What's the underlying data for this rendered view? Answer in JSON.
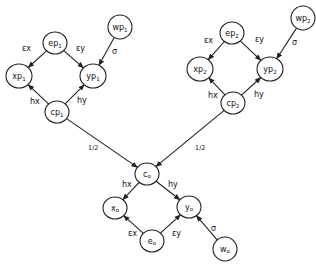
{
  "diagram": {
    "nodes": [
      {
        "id": "ep1",
        "base": "e",
        "sub": "p",
        "subsub": "1",
        "x": 55,
        "y": 43,
        "rx": 12,
        "ry": 11
      },
      {
        "id": "wp1",
        "base": "w",
        "sub": "p",
        "subsub": "1",
        "x": 120,
        "y": 27,
        "rx": 12,
        "ry": 12
      },
      {
        "id": "xp1",
        "base": "x",
        "sub": "p",
        "subsub": "1",
        "x": 19,
        "y": 76,
        "rx": 13,
        "ry": 12
      },
      {
        "id": "yp1",
        "base": "y",
        "sub": "p",
        "subsub": "1",
        "x": 93,
        "y": 76,
        "rx": 13,
        "ry": 12
      },
      {
        "id": "cp1",
        "base": "c",
        "sub": "p",
        "subsub": "1",
        "x": 57,
        "y": 112,
        "rx": 12,
        "ry": 11
      },
      {
        "id": "ep2",
        "base": "e",
        "sub": "p",
        "subsub": "2",
        "x": 232,
        "y": 33,
        "rx": 12,
        "ry": 11
      },
      {
        "id": "wp2",
        "base": "w",
        "sub": "p",
        "subsub": "2",
        "x": 303,
        "y": 18,
        "rx": 12,
        "ry": 12
      },
      {
        "id": "xp2",
        "base": "x",
        "sub": "p",
        "subsub": "2",
        "x": 200,
        "y": 69,
        "rx": 13,
        "ry": 12
      },
      {
        "id": "yp2",
        "base": "y",
        "sub": "p",
        "subsub": "2",
        "x": 270,
        "y": 69,
        "rx": 13,
        "ry": 12
      },
      {
        "id": "cp2",
        "base": "c",
        "sub": "p",
        "subsub": "2",
        "x": 233,
        "y": 103,
        "rx": 12,
        "ry": 11
      },
      {
        "id": "co",
        "base": "c",
        "sub": "o",
        "subsub": "",
        "x": 147,
        "y": 174,
        "rx": 12,
        "ry": 11
      },
      {
        "id": "xo",
        "base": "x",
        "sub": "o",
        "subsub": "",
        "x": 115,
        "y": 208,
        "rx": 12,
        "ry": 11
      },
      {
        "id": "yo",
        "base": "y",
        "sub": "o",
        "subsub": "",
        "x": 189,
        "y": 207,
        "rx": 12,
        "ry": 11
      },
      {
        "id": "eo",
        "base": "e",
        "sub": "o",
        "subsub": "",
        "x": 152,
        "y": 241,
        "rx": 12,
        "ry": 11
      },
      {
        "id": "wo",
        "base": "w",
        "sub": "o",
        "subsub": "",
        "x": 225,
        "y": 249,
        "rx": 12,
        "ry": 12
      }
    ],
    "edges": [
      {
        "from": "ep1",
        "to": "xp1",
        "label": "εx",
        "lx": 22,
        "ly": 51
      },
      {
        "from": "ep1",
        "to": "yp1",
        "label": "εy",
        "lx": 76,
        "ly": 51
      },
      {
        "from": "wp1",
        "to": "yp1",
        "label": "σ",
        "lx": 112,
        "ly": 54
      },
      {
        "from": "cp1",
        "to": "xp1",
        "label": "hx",
        "lx": 30,
        "ly": 104
      },
      {
        "from": "cp1",
        "to": "yp1",
        "label": "hy",
        "lx": 77,
        "ly": 103
      },
      {
        "from": "ep2",
        "to": "xp2",
        "label": "εx",
        "lx": 204,
        "ly": 43
      },
      {
        "from": "ep2",
        "to": "yp2",
        "label": "εy",
        "lx": 255,
        "ly": 42
      },
      {
        "from": "wp2",
        "to": "yp2",
        "label": "σ",
        "lx": 292,
        "ly": 45
      },
      {
        "from": "cp2",
        "to": "xp2",
        "label": "hx",
        "lx": 208,
        "ly": 98
      },
      {
        "from": "cp2",
        "to": "yp2",
        "label": "hy",
        "lx": 254,
        "ly": 97
      },
      {
        "from": "cp1",
        "to": "co",
        "label": "1/2",
        "lx": 88,
        "ly": 150
      },
      {
        "from": "cp2",
        "to": "co",
        "label": "1/2",
        "lx": 195,
        "ly": 150
      },
      {
        "from": "co",
        "to": "xo",
        "label": "hx",
        "lx": 122,
        "ly": 187
      },
      {
        "from": "co",
        "to": "yo",
        "label": "hy",
        "lx": 168,
        "ly": 187
      },
      {
        "from": "eo",
        "to": "xo",
        "label": "εx",
        "lx": 128,
        "ly": 236
      },
      {
        "from": "eo",
        "to": "yo",
        "label": "εy",
        "lx": 172,
        "ly": 236
      },
      {
        "from": "wo",
        "to": "yo",
        "label": "σ",
        "lx": 211,
        "ly": 231
      }
    ]
  }
}
